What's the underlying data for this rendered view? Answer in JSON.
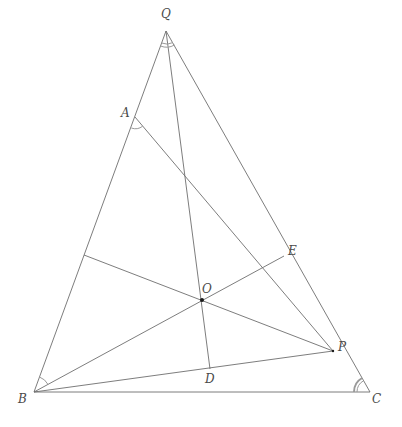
{
  "diagram": {
    "colors": {
      "line": "#6e6e6e",
      "arc": "#9a9a9a",
      "label": "#4a4a4a",
      "point": "#1a1a1a",
      "background": "#ffffff"
    },
    "points": [
      {
        "id": "Q",
        "label": "Q",
        "x": 166,
        "y": 31,
        "label_x": 161,
        "label_y": 8
      },
      {
        "id": "A",
        "label": "A",
        "x": 135,
        "y": 117,
        "label_x": 121,
        "label_y": 107
      },
      {
        "id": "E",
        "label": "E",
        "x": 284,
        "y": 256,
        "label_x": 288,
        "label_y": 245
      },
      {
        "id": "O",
        "label": "O",
        "x": 202,
        "y": 300,
        "label_x": 202,
        "label_y": 283
      },
      {
        "id": "P",
        "label": "P",
        "x": 333,
        "y": 351,
        "label_x": 338,
        "label_y": 341
      },
      {
        "id": "D",
        "label": "D",
        "x": 210,
        "y": 369,
        "label_x": 205,
        "label_y": 373
      },
      {
        "id": "B",
        "label": "B",
        "x": 34,
        "y": 392,
        "label_x": 18,
        "label_y": 393
      },
      {
        "id": "C",
        "label": "C",
        "x": 370,
        "y": 392,
        "label_x": 372,
        "label_y": 393
      },
      {
        "id": "F",
        "label": "",
        "x": 84,
        "y": 255
      }
    ],
    "segments": [
      {
        "from": "Q",
        "to": "B"
      },
      {
        "from": "Q",
        "to": "C"
      },
      {
        "from": "B",
        "to": "C"
      },
      {
        "from": "A",
        "to": "P"
      },
      {
        "from": "Q",
        "to": "D"
      },
      {
        "from": "B",
        "to": "P"
      },
      {
        "from": "B",
        "to": "E"
      },
      {
        "from": "F",
        "to": "P"
      }
    ],
    "angle_marks": [
      {
        "vertex": "Q",
        "type": "double"
      },
      {
        "vertex": "A",
        "type": "single"
      },
      {
        "vertex": "B",
        "type": "single"
      },
      {
        "vertex": "C",
        "type": "double"
      }
    ]
  }
}
